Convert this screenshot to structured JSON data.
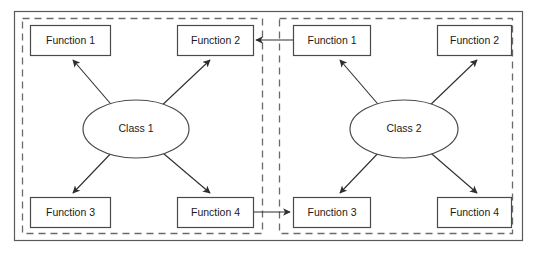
{
  "diagram": {
    "background_color": "#ffffff",
    "outer_frame": {
      "name": "outer-frame",
      "style": "solid",
      "color": "#5a5a5a"
    },
    "panel_border": {
      "style": "dashed",
      "color": "#6b6b6b"
    },
    "node_border_color": "#4a4a4a",
    "edge_color": "#2e2e2e",
    "panels": [
      {
        "id": "panel-class-1",
        "class_node": {
          "id": "class-1",
          "label": "Class 1",
          "shape": "ellipse"
        },
        "functions": [
          {
            "id": "c1-function-1",
            "label": "Function 1",
            "position": "top-left"
          },
          {
            "id": "c1-function-2",
            "label": "Function 2",
            "position": "top-right"
          },
          {
            "id": "c1-function-3",
            "label": "Function 3",
            "position": "bottom-left"
          },
          {
            "id": "c1-function-4",
            "label": "Function 4",
            "position": "bottom-right"
          }
        ]
      },
      {
        "id": "panel-class-2",
        "class_node": {
          "id": "class-2",
          "label": "Class 2",
          "shape": "ellipse"
        },
        "functions": [
          {
            "id": "c2-function-1",
            "label": "Function 1",
            "position": "top-left"
          },
          {
            "id": "c2-function-2",
            "label": "Function 2",
            "position": "top-right"
          },
          {
            "id": "c2-function-3",
            "label": "Function 3",
            "position": "bottom-left"
          },
          {
            "id": "c2-function-4",
            "label": "Function 4",
            "position": "bottom-right"
          }
        ]
      }
    ],
    "internal_edges": [
      {
        "from": "class-1",
        "to": "c1-function-1",
        "arrow": "to"
      },
      {
        "from": "class-1",
        "to": "c1-function-2",
        "arrow": "to"
      },
      {
        "from": "class-1",
        "to": "c1-function-3",
        "arrow": "to"
      },
      {
        "from": "class-1",
        "to": "c1-function-4",
        "arrow": "to"
      },
      {
        "from": "class-2",
        "to": "c2-function-1",
        "arrow": "to"
      },
      {
        "from": "class-2",
        "to": "c2-function-2",
        "arrow": "to"
      },
      {
        "from": "class-2",
        "to": "c2-function-3",
        "arrow": "to"
      },
      {
        "from": "class-2",
        "to": "c2-function-4",
        "arrow": "to"
      }
    ],
    "cross_panel_edges": [
      {
        "from": "c2-function-1",
        "to": "c1-function-2",
        "arrow": "to",
        "direction": "right-to-left"
      },
      {
        "from": "c1-function-4",
        "to": "c2-function-3",
        "arrow": "to",
        "direction": "left-to-right"
      }
    ]
  }
}
